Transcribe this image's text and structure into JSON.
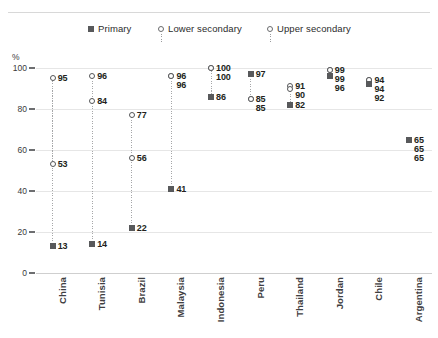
{
  "chart": {
    "axis_unit_label": "%",
    "y_ticks": [
      "0",
      "20",
      "40",
      "60",
      "80",
      "100"
    ]
  },
  "legend": {
    "primary": "Primary",
    "lower_secondary": "Lower secondary",
    "upper_secondary": "Upper secondary"
  },
  "chart_data": {
    "type": "scatter",
    "title": "",
    "xlabel": "",
    "ylabel": "%",
    "ylim": [
      0,
      100
    ],
    "ytick_step": 20,
    "grid": true,
    "legend_position": "top",
    "categories": [
      "China",
      "Tunisia",
      "Brazil",
      "Malaysia",
      "Indonesia",
      "Peru",
      "Thailand",
      "Jordan",
      "Chile",
      "Argentina"
    ],
    "series": [
      {
        "name": "Primary",
        "marker": "filled-square",
        "values": [
          13,
          14,
          22,
          41,
          86,
          97,
          82,
          96,
          92,
          65
        ]
      },
      {
        "name": "Lower secondary",
        "marker": "open-circle",
        "values": [
          53,
          84,
          56,
          96,
          100,
          85,
          90,
          99,
          94,
          65
        ]
      },
      {
        "name": "Upper secondary",
        "marker": "open-circle",
        "values": [
          95,
          96,
          77,
          96,
          100,
          85,
          91,
          99,
          94,
          65
        ]
      }
    ],
    "point_labels": {
      "China": [
        "13",
        "53",
        "95"
      ],
      "Tunisia": [
        "14",
        "84",
        "96"
      ],
      "Brazil": [
        "22",
        "56",
        "77"
      ],
      "Malaysia": [
        "41",
        "96",
        "96"
      ],
      "Indonesia": [
        "86",
        "100",
        "100"
      ],
      "Peru": [
        "97",
        "85",
        "85"
      ],
      "Thailand": [
        "82",
        "90",
        "91"
      ],
      "Jordan": [
        "96",
        "99",
        "99"
      ],
      "Chile": [
        "92",
        "94",
        "94"
      ],
      "Argentina": [
        "65",
        "65",
        "65"
      ]
    }
  }
}
